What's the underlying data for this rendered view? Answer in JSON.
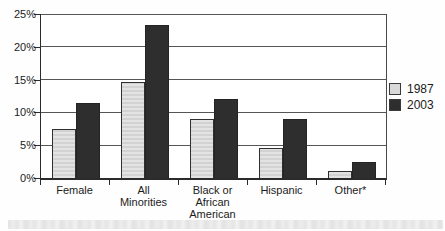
{
  "chart_data": {
    "type": "bar",
    "title": "",
    "xlabel": "",
    "ylabel": "",
    "categories": [
      "Female",
      "All Minorities",
      "Black or African American",
      "Hispanic",
      "Other*"
    ],
    "xtick_labels": [
      "Female",
      "All\nMinorities",
      "Black or\nAfrican\nAmerican",
      "Hispanic",
      "Other*"
    ],
    "series": [
      {
        "name": "1987",
        "color": "#d9d9d9",
        "values": [
          7.5,
          14.7,
          9.0,
          4.5,
          1.0
        ]
      },
      {
        "name": "2003",
        "color": "#2e2e2e",
        "values": [
          11.5,
          23.4,
          12.0,
          9.0,
          2.5
        ]
      }
    ],
    "ylim": [
      0,
      25
    ],
    "ytick_step": 5,
    "ytick_labels": [
      "0%",
      "5%",
      "10%",
      "15%",
      "20%",
      "25%"
    ],
    "grid": true,
    "legend_position": "right"
  },
  "colors": {
    "grid": "#565656",
    "axis": "#2b2b2b",
    "text": "#1b1b1b",
    "background": "#fefefe"
  }
}
